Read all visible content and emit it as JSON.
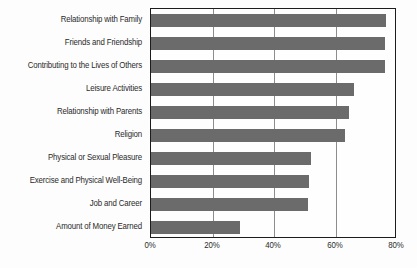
{
  "chart_data": {
    "type": "bar",
    "orientation": "horizontal",
    "title": "",
    "subtitle": "",
    "xlabel": "",
    "ylabel": "",
    "xlim": [
      0,
      80
    ],
    "grid": true,
    "legend": null,
    "legend_position": "none",
    "bar_color": "#6b6b6b",
    "axis_color": "#1c1c1c",
    "gridline_color": "#8d8d8d",
    "background_color": "#fdfdfd",
    "text_color": "#2a2a2a",
    "tick_labels": [
      "0%",
      "20%",
      "40%",
      "60%",
      "80%"
    ],
    "tick_values": [
      0,
      20,
      40,
      60,
      80
    ],
    "categories": [
      "Relationship with Family",
      "Friends and Friendship",
      "Contributing to the Lives of Others",
      "Leisure Activities",
      "Relationship with Parents",
      "Religion",
      "Physical or Sexual Pleasure",
      "Exercise and Physical Well-Being",
      "Job and Career",
      "Amount of Money Earned"
    ],
    "values": [
      76.5,
      76,
      76,
      66,
      64.5,
      63,
      52,
      51.5,
      51,
      29
    ],
    "value_unit": "%"
  }
}
